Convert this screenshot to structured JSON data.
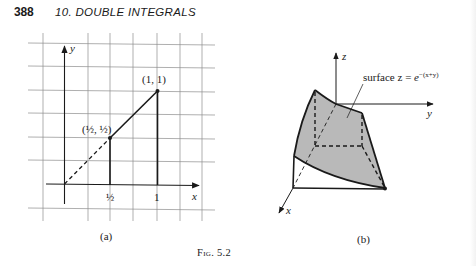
{
  "header": {
    "page_number": "388",
    "chapter_title": "10. DOUBLE INTEGRALS"
  },
  "figure_a": {
    "sublabel": "(a)",
    "axis_x_label": "x",
    "axis_y_label": "y",
    "tick_half": "½",
    "tick_one": "1",
    "point_half_label": "(½, ½)",
    "point_one_label": "(1, 1)"
  },
  "figure_b": {
    "sublabel": "(b)",
    "axis_x_label": "x",
    "axis_y_label": "y",
    "axis_z_label": "z",
    "surface_label": "surface z = ",
    "surface_expr_base": "e",
    "surface_expr_exp": "−(x+y)"
  },
  "caption": "Fig. 5.2"
}
